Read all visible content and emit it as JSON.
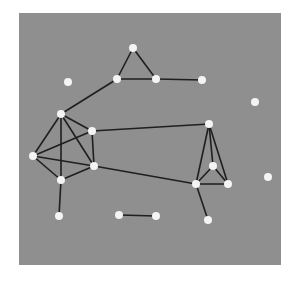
{
  "diagram": {
    "type": "undirected-graph",
    "background_color": "#ffffff",
    "panel": {
      "x": 19,
      "y": 13,
      "width": 262,
      "height": 252,
      "fill": "#8f8f8f"
    },
    "edge_color": "#1f1f1f",
    "node_color": "#f4f4f4",
    "node_radius": 4,
    "nodes": [
      {
        "id": "K",
        "x": 133,
        "y": 48
      },
      {
        "id": "L",
        "x": 117,
        "y": 79
      },
      {
        "id": "M",
        "x": 156,
        "y": 79
      },
      {
        "id": "N",
        "x": 202,
        "y": 80
      },
      {
        "id": "O",
        "x": 68,
        "y": 82
      },
      {
        "id": "P",
        "x": 255,
        "y": 102
      },
      {
        "id": "A",
        "x": 61,
        "y": 114
      },
      {
        "id": "B",
        "x": 92,
        "y": 131
      },
      {
        "id": "F",
        "x": 209,
        "y": 124
      },
      {
        "id": "C",
        "x": 33,
        "y": 156
      },
      {
        "id": "D",
        "x": 94,
        "y": 166
      },
      {
        "id": "G",
        "x": 213,
        "y": 166
      },
      {
        "id": "Q",
        "x": 268,
        "y": 177
      },
      {
        "id": "E",
        "x": 61,
        "y": 180
      },
      {
        "id": "H",
        "x": 196,
        "y": 184
      },
      {
        "id": "I",
        "x": 228,
        "y": 184
      },
      {
        "id": "R",
        "x": 59,
        "y": 216
      },
      {
        "id": "S",
        "x": 119,
        "y": 215
      },
      {
        "id": "T",
        "x": 156,
        "y": 216
      },
      {
        "id": "J",
        "x": 208,
        "y": 220
      }
    ],
    "edges": [
      [
        "K",
        "L"
      ],
      [
        "K",
        "M"
      ],
      [
        "L",
        "M"
      ],
      [
        "M",
        "N"
      ],
      [
        "L",
        "A"
      ],
      [
        "A",
        "B"
      ],
      [
        "A",
        "C"
      ],
      [
        "A",
        "D"
      ],
      [
        "A",
        "E"
      ],
      [
        "B",
        "C"
      ],
      [
        "B",
        "D"
      ],
      [
        "C",
        "D"
      ],
      [
        "C",
        "E"
      ],
      [
        "D",
        "E"
      ],
      [
        "E",
        "R"
      ],
      [
        "B",
        "F"
      ],
      [
        "D",
        "H"
      ],
      [
        "F",
        "G"
      ],
      [
        "F",
        "H"
      ],
      [
        "F",
        "I"
      ],
      [
        "G",
        "H"
      ],
      [
        "G",
        "I"
      ],
      [
        "H",
        "I"
      ],
      [
        "H",
        "J"
      ],
      [
        "S",
        "T"
      ]
    ]
  }
}
